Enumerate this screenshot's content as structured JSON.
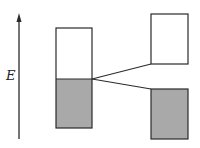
{
  "diagram": {
    "axis_label": "E",
    "colors": {
      "stroke": "#2a2a2a",
      "filled": "#a9a9a9",
      "empty": "#ffffff"
    },
    "elements": [
      {
        "id": "energy-axis",
        "type": "arrow",
        "direction": "up"
      },
      {
        "id": "left-band",
        "type": "band",
        "upper": "empty",
        "lower": "filled"
      },
      {
        "id": "right-upper-band",
        "type": "band",
        "fill": "empty"
      },
      {
        "id": "right-lower-band",
        "type": "band",
        "fill": "filled"
      },
      {
        "id": "split-lines",
        "type": "connector",
        "from": "left-band-boundary",
        "to": [
          "right-upper-band-bottom",
          "right-lower-band-top"
        ]
      }
    ]
  }
}
